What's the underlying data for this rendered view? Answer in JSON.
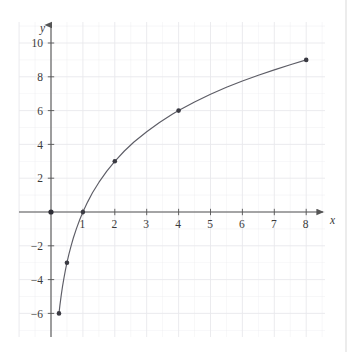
{
  "figure": {
    "title": "",
    "x_axis_label": "x",
    "y_axis_label": "y",
    "background_color": "#ffffff",
    "grid_color": "#e9e9ec",
    "axis_color": "#555555",
    "curve_color": "#5d5d66",
    "point_color": "#3a3a42"
  },
  "chart_data": {
    "type": "line",
    "title": "",
    "xlabel": "x",
    "ylabel": "y",
    "xlim": [
      -1,
      9
    ],
    "ylim": [
      -7,
      11
    ],
    "grid": true,
    "legend": "none",
    "x_ticks": [
      1,
      2,
      3,
      4,
      5,
      6,
      7,
      8
    ],
    "x_tick_labels": [
      "1",
      "2",
      "3",
      "4",
      "5",
      "6",
      "7",
      "8"
    ],
    "y_ticks": [
      -6,
      -4,
      -2,
      2,
      4,
      6,
      8,
      10
    ],
    "y_tick_labels": [
      "−6",
      "−4",
      "−2",
      "2",
      "4",
      "6",
      "8",
      "10"
    ],
    "series": [
      {
        "name": "y = 3 log2(x)",
        "marked_points": [
          {
            "x": 0.25,
            "y": -6,
            "label": "(0.25, −6)"
          },
          {
            "x": 0.5,
            "y": -3,
            "label": "(0.5, −3)"
          },
          {
            "x": 1,
            "y": 0,
            "label": "(1, 0)"
          },
          {
            "x": 2,
            "y": 3,
            "label": "(2, 3)"
          },
          {
            "x": 4,
            "y": 6,
            "label": "(4, 6)"
          },
          {
            "x": 8,
            "y": 9,
            "label": "(8, 9)"
          }
        ],
        "curve_x": [
          0.25,
          0.28,
          0.32,
          0.36,
          0.4,
          0.45,
          0.5,
          0.56,
          0.63,
          0.7,
          0.8,
          0.9,
          1.0,
          1.15,
          1.3,
          1.5,
          1.75,
          2.0,
          2.3,
          2.6,
          3.0,
          3.4,
          3.8,
          4.0,
          4.5,
          5.0,
          5.5,
          6.0,
          6.5,
          7.0,
          7.5,
          8.0
        ],
        "curve_y": [
          -6.0,
          -5.51,
          -4.93,
          -4.42,
          -3.97,
          -3.46,
          -3.0,
          -2.51,
          -2.0,
          -1.54,
          -0.97,
          -0.46,
          0.0,
          0.6,
          1.14,
          1.75,
          2.42,
          3.0,
          3.61,
          4.14,
          4.75,
          5.3,
          5.78,
          6.0,
          6.51,
          6.97,
          7.38,
          7.75,
          8.09,
          8.41,
          8.71,
          9.0
        ]
      }
    ]
  },
  "origin_marker": {
    "x": 0,
    "y": 0,
    "name": "origin-point"
  }
}
